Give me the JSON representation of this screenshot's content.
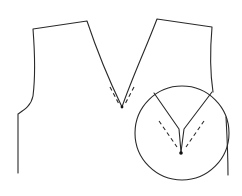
{
  "diagram": {
    "title": "",
    "description": "Garment pattern: front bodice pieces with V-neckline and magnified detail circle of the V point",
    "colors": {
      "stroke": "#2a2a2a",
      "dot": "#111111",
      "background": "#ffffff"
    },
    "elements": [
      {
        "id": "left-bodice-panel",
        "type": "outline"
      },
      {
        "id": "right-bodice-panel",
        "type": "outline"
      },
      {
        "id": "neckline-v-point",
        "type": "dot"
      },
      {
        "id": "seam-allowance-dashes",
        "type": "dashed-lines"
      },
      {
        "id": "detail-magnifier-circle",
        "type": "circle"
      },
      {
        "id": "detail-v-point",
        "type": "dot"
      },
      {
        "id": "detail-seam-dashes",
        "type": "dashed-lines"
      }
    ]
  }
}
